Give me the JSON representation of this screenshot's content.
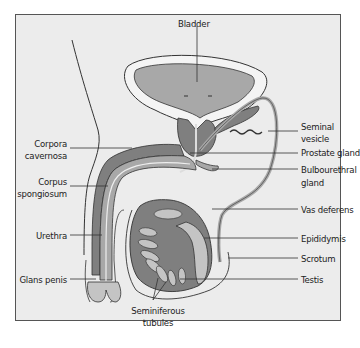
{
  "diagram": {
    "colors": {
      "background": "#ececec",
      "frame": "#555555",
      "dark_tissue": "#7f7f7f",
      "mid_tissue": "#a8a8a8",
      "light_tissue": "#c4c4c4",
      "outline": "#333333"
    },
    "labels": {
      "bladder": "Bladder",
      "seminal_vesicle_1": "Seminal",
      "seminal_vesicle_2": "vesicle",
      "prostate_gland": "Prostate gland",
      "bulbourethral_1": "Bulbourethral",
      "bulbourethral_2": "gland",
      "vas_deferens": "Vas deferens",
      "epididymis": "Epididymis",
      "scrotum": "Scrotum",
      "testis": "Testis",
      "corpora_cavernosa_1": "Corpora",
      "corpora_cavernosa_2": "cavernosa",
      "corpus_spongiosum_1": "Corpus",
      "corpus_spongiosum_2": "spongiosum",
      "urethra": "Urethra",
      "glans_penis": "Glans penis",
      "seminiferous_1": "Seminiferous",
      "seminiferous_2": "tubules"
    }
  }
}
